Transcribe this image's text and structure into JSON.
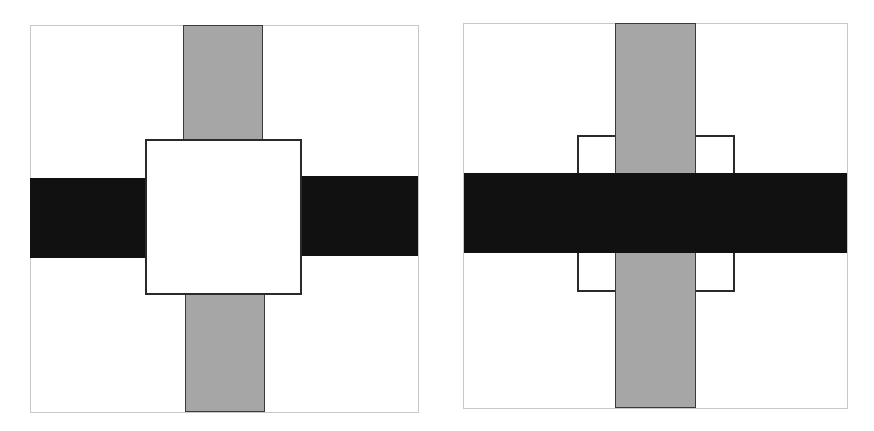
{
  "colors": {
    "background": "#ffffff",
    "frame": "#c8c8c8",
    "vertical_bar": "#a6a6a6",
    "horizontal_bar": "#111111",
    "outline": "#2a2a2a"
  },
  "panels": [
    {
      "id": "left",
      "description": "Square drawn on top of both bars",
      "frame": {
        "x": 30,
        "y": 25,
        "w": 389,
        "h": 388
      },
      "layers_bottom_to_top": [
        "horizontal-bar",
        "vertical-bar",
        "square"
      ]
    },
    {
      "id": "right",
      "description": "Horizontal bar over vertical bar over square",
      "frame": {
        "x": 463,
        "y": 23,
        "w": 385,
        "h": 386
      },
      "layers_bottom_to_top": [
        "square",
        "vertical-bar",
        "horizontal-bar"
      ]
    }
  ]
}
